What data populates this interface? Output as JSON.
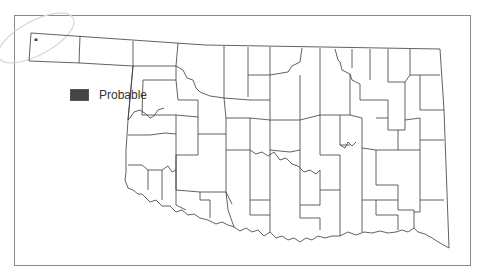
{
  "map": {
    "region": "Oklahoma counties",
    "outline_color": "#333333",
    "background": "#ffffff",
    "frame_color": "#8a8a8a",
    "highlight_ellipse_color": "#d8d8d8",
    "markers": [
      {
        "category": "Probable",
        "x": 36,
        "y": 40,
        "color": "#444444"
      }
    ]
  },
  "legend": {
    "items": [
      {
        "label": "Probable",
        "color": "#444444"
      }
    ]
  }
}
